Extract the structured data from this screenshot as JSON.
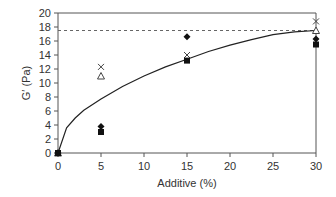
{
  "chart_data": {
    "type": "scatter",
    "title": "",
    "xlabel": "Additive (%)",
    "ylabel": "G′ (Pa)",
    "xlim": [
      0,
      30
    ],
    "ylim": [
      0,
      20
    ],
    "xticks": [
      0,
      5,
      10,
      15,
      20,
      25,
      30
    ],
    "yticks": [
      0,
      2,
      4,
      6,
      8,
      10,
      12,
      14,
      16,
      18,
      20
    ],
    "grid": false,
    "legend": null,
    "series": [
      {
        "name": "cross",
        "marker": "x",
        "x": [
          0,
          5,
          15,
          30
        ],
        "y": [
          0,
          12.3,
          14.0,
          18.8
        ]
      },
      {
        "name": "triangle",
        "marker": "triangle-open",
        "x": [
          0,
          5,
          30
        ],
        "y": [
          0,
          11.0,
          17.5
        ]
      },
      {
        "name": "diamond",
        "marker": "diamond-filled",
        "x": [
          0,
          5,
          15,
          30
        ],
        "y": [
          0,
          3.8,
          16.6,
          16.3
        ]
      },
      {
        "name": "square",
        "marker": "square-filled",
        "x": [
          0,
          5,
          15,
          30
        ],
        "y": [
          0,
          3.0,
          13.2,
          15.5
        ]
      }
    ],
    "fit_curve": {
      "style": "solid",
      "description": "saturating fit curve",
      "x": [
        0,
        1,
        2,
        3,
        5,
        7.5,
        10,
        12.5,
        15,
        17.5,
        20,
        22.5,
        25,
        27.5,
        30
      ],
      "y": [
        0,
        3.6,
        5.0,
        6.1,
        7.7,
        9.5,
        11.0,
        12.3,
        13.4,
        14.5,
        15.4,
        16.2,
        16.9,
        17.3,
        17.5
      ]
    },
    "reference_line": {
      "style": "dashed",
      "y": 17.5
    }
  }
}
